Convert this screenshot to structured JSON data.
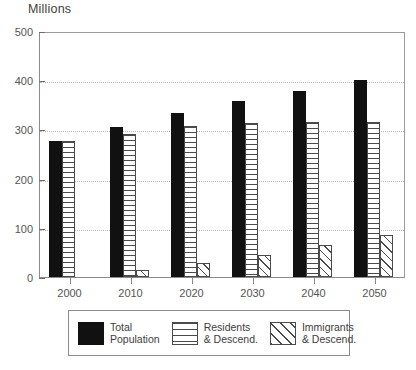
{
  "chart_data": {
    "type": "bar",
    "title": "",
    "ylabel": "Millions",
    "xlabel": "",
    "ylim": [
      0,
      500
    ],
    "ytick_values": [
      0,
      100,
      200,
      300,
      400,
      500
    ],
    "ytick_labels": [
      "0",
      "100",
      "200",
      "300",
      "400",
      "500"
    ],
    "grid": "horizontal-dotted",
    "gridline_values": [
      100,
      200,
      300,
      400
    ],
    "legend_position": "bottom-outside",
    "categories": [
      "2000",
      "2010",
      "2020",
      "2030",
      "2040",
      "2050"
    ],
    "series": [
      {
        "name": "Total Population",
        "pattern": "solid-black",
        "color": "#111111",
        "values": [
          277,
          305,
          333,
          357,
          379,
          400
        ]
      },
      {
        "name": "Residents & Descend.",
        "pattern": "horizontal-lines",
        "color": "#4a4a4a",
        "values": [
          277,
          291,
          306,
          313,
          315,
          315
        ]
      },
      {
        "name": "Immigrants & Descend.",
        "pattern": "diagonal-hatch",
        "color": "#4a4a4a",
        "values": [
          0,
          14,
          28,
          45,
          65,
          85
        ]
      }
    ]
  },
  "legend": {
    "entries": [
      {
        "label_line1": "Total",
        "label_line2": "Population",
        "swatch": "solid-black-swatch"
      },
      {
        "label_line1": "Residents",
        "label_line2": "& Descend.",
        "swatch": "horizontal-lines-swatch"
      },
      {
        "label_line1": "Immigrants",
        "label_line2": "& Descend.",
        "swatch": "diagonal-hatch-swatch"
      }
    ]
  }
}
